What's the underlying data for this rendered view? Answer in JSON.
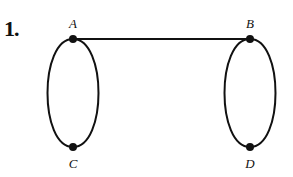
{
  "problem": {
    "number": "1."
  },
  "graph": {
    "vertices": [
      {
        "id": "A",
        "label": "A",
        "x": 73,
        "y": 39
      },
      {
        "id": "B",
        "label": "B",
        "x": 250,
        "y": 39
      },
      {
        "id": "C",
        "label": "C",
        "x": 73,
        "y": 147
      },
      {
        "id": "D",
        "label": "D",
        "x": 250,
        "y": 147
      }
    ],
    "edges": [
      {
        "from": "A",
        "to": "B",
        "type": "straight"
      },
      {
        "from": "A",
        "to": "C",
        "type": "curve-left"
      },
      {
        "from": "A",
        "to": "C",
        "type": "curve-right"
      },
      {
        "from": "B",
        "to": "D",
        "type": "curve-left"
      },
      {
        "from": "B",
        "to": "D",
        "type": "curve-right"
      }
    ],
    "colors": {
      "stroke": "#111111",
      "background": "#ffffff"
    }
  }
}
